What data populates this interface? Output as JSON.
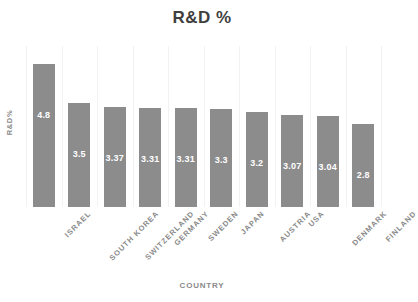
{
  "chart_data": {
    "type": "bar",
    "title": "R&D %",
    "xlabel": "COUNTRY",
    "ylabel": "R&D%",
    "categories": [
      "ISRAEL",
      "SOUTH KOREA",
      "SWITZERLAND",
      "GERMANY",
      "SWEDEN",
      "JAPAN",
      "AUSTRIA",
      "USA",
      "DENMARK",
      "FINLAND"
    ],
    "values": [
      4.8,
      3.5,
      3.37,
      3.31,
      3.31,
      3.3,
      3.2,
      3.07,
      3.04,
      2.8
    ],
    "value_labels": [
      "4.8",
      "3.5",
      "3.37",
      "3.31",
      "3.31",
      "3.3",
      "3.2",
      "3.07",
      "3.04",
      "2.8"
    ],
    "ylim": [
      0,
      5.4
    ],
    "grid": "vertical-category-separators",
    "legend": "none",
    "bar_color": "#8c8c8c",
    "label_color": "#ffffff",
    "axis_text_color": "#8a8a8a",
    "title_color": "#3f3f3f",
    "background": "#ffffff"
  }
}
